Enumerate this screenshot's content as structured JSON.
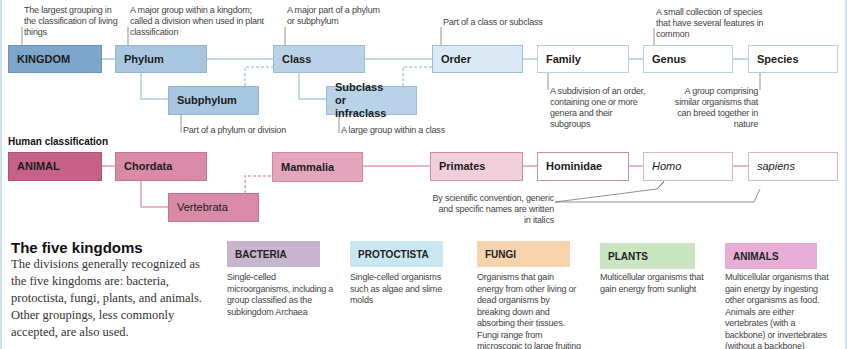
{
  "colors": {
    "kingdom": "#7ea6cc",
    "phylum": "#a9c6e0",
    "class": "#bad2e8",
    "order": "#dbe9f5",
    "blue_border": "#9dbcd8",
    "blue_line": "#c3d8ea",
    "animal": "#c66287",
    "chordata": "#d98aa7",
    "mammalia": "#e3a6bd",
    "primates": "#f0cfdb",
    "pink_border": "#d08ba5",
    "pink_line": "#e8b6c8",
    "bacteria": "#c7b4cd",
    "protoctista": "#c9e6f1",
    "fungi": "#f7d4ae",
    "plants": "#c9e5c1",
    "animals": "#e6aed6"
  },
  "hierarchy": {
    "boxes": [
      {
        "id": "kingdom",
        "label": "KINGDOM"
      },
      {
        "id": "phylum",
        "label": "Phylum"
      },
      {
        "id": "subphylum",
        "label": "Subphylum"
      },
      {
        "id": "class",
        "label": "Class"
      },
      {
        "id": "subclass",
        "label": "Subclass or infraclass"
      },
      {
        "id": "order",
        "label": "Order"
      },
      {
        "id": "family",
        "label": "Family"
      },
      {
        "id": "genus",
        "label": "Genus"
      },
      {
        "id": "species",
        "label": "Species"
      }
    ],
    "notes": {
      "kingdom": "The largest grouping in the classification of living things",
      "phylum": "A major group within a kingdom; called a division when used in plant classification",
      "class": "A major part of a phylum or subphylum",
      "order": "Part of a class or subclass",
      "genus": "A small collection of species that have several features in common",
      "subphylum": "Part of a phylum or division",
      "subclass": "A large group within a class",
      "family": "A subdivision of an order, containing one or more genera and their subgroups",
      "species": "A group comprising similar organisms that can breed together in nature"
    }
  },
  "human": {
    "heading": "Human classification",
    "boxes": [
      {
        "id": "animal",
        "label": "ANIMAL"
      },
      {
        "id": "chordata",
        "label": "Chordata"
      },
      {
        "id": "vertebrata",
        "label": "Vertebrata"
      },
      {
        "id": "mammalia",
        "label": "Mammalia"
      },
      {
        "id": "primates",
        "label": "Primates"
      },
      {
        "id": "hominidae",
        "label": "Hominidae"
      },
      {
        "id": "homo",
        "label": "Homo"
      },
      {
        "id": "sapiens",
        "label": "sapiens"
      }
    ],
    "italics_note": "By scientific convention, generic and specific names are written in italics"
  },
  "five_kingdoms": {
    "title": "The five kingdoms",
    "paragraph": "The divisions generally recognized as the five kingdoms are: bacteria, protoctista, fungi, plants, and animals. Other groupings, less commonly accepted, are also used.",
    "items": [
      {
        "label": "BACTERIA",
        "description": "Single-celled microorganisms, including a group classified as the subkingdom Archaea"
      },
      {
        "label": "PROTOCTISTA",
        "description": "Single-celled organisms such as algae and slime molds"
      },
      {
        "label": "FUNGI",
        "description": "Organisms that gain energy from other living or dead organisms by breaking down and absorbing their tissues. Fungi range from microscopic to large fruiting bodies"
      },
      {
        "label": "PLANTS",
        "description": "Multicellular organisms that gain energy from sunlight"
      },
      {
        "label": "ANIMALS",
        "description": "Multicellular organisms that gain energy by ingesting other organisms as food. Animals are either vertebrates (with a backbone) or invertebrates (without a backbone)"
      }
    ]
  }
}
